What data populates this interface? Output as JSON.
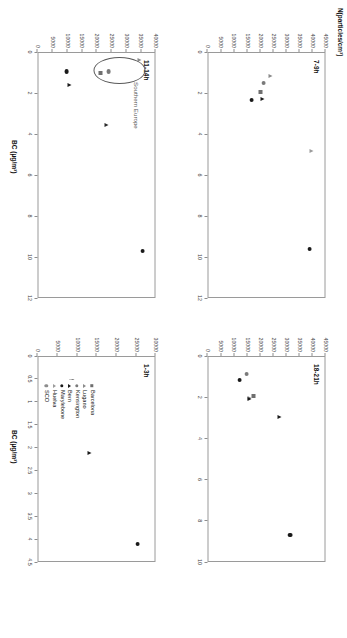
{
  "figure": {
    "y_axis_label": "N(particles/cm³)",
    "x_axis_label": "BC (µg/m³)",
    "annotation_text": "Southern Europe"
  },
  "legend": {
    "items": [
      {
        "label": "Barcelona",
        "marker": "square",
        "color": "#6f6f6f"
      },
      {
        "label": "Lugano",
        "marker": "triangle",
        "color": "#8a8a8a"
      },
      {
        "label": "Kensington",
        "marker": "circle",
        "color": "#7a7a7a"
      },
      {
        "label": "Bern",
        "marker": "triangle",
        "color": "#1a1a1a"
      },
      {
        "label": "Marylebone",
        "marker": "circle",
        "color": "#1a1a1a"
      },
      {
        "label": "Huelva",
        "marker": "triangle",
        "color": "#9b9b9b"
      },
      {
        "label": "SCO",
        "marker": "circle",
        "color": "#8d8d8d"
      }
    ]
  },
  "chart_data": [
    {
      "id": "panel-7-9h",
      "type": "scatter",
      "title": "7-9h",
      "xlabel": "BC (µg/m³)",
      "ylabel": "N(particles/cm³)",
      "xlim": [
        0,
        12
      ],
      "ylim": [
        0,
        45000
      ],
      "xticks": [
        0,
        2,
        4,
        6,
        8,
        10,
        12
      ],
      "yticks": [
        0,
        5000,
        10000,
        15000,
        20000,
        25000,
        30000,
        35000,
        40000,
        45000
      ],
      "grid": false,
      "points": [
        {
          "site": "Barcelona",
          "marker": "square",
          "color": "#6f6f6f",
          "x": 1.95,
          "y": 20200
        },
        {
          "site": "Lugano",
          "marker": "triangle",
          "color": "#8a8a8a",
          "x": 1.15,
          "y": 24200
        },
        {
          "site": "Kensington",
          "marker": "circle",
          "color": "#7a7a7a",
          "x": 1.5,
          "y": 21500
        },
        {
          "site": "Bern",
          "marker": "triangle",
          "color": "#1a1a1a",
          "x": 2.3,
          "y": 21000
        },
        {
          "site": "Marylebone",
          "marker": "circle",
          "color": "#1a1a1a",
          "x": 2.35,
          "y": 16800
        },
        {
          "site": "Huelva",
          "marker": "triangle",
          "color": "#9b9b9b",
          "x": 4.85,
          "y": 39500
        },
        {
          "site": "SCO",
          "marker": "circle",
          "color": "#1a1a1a",
          "x": 9.6,
          "y": 39000
        }
      ]
    },
    {
      "id": "panel-11-14h",
      "type": "scatter",
      "title": "11-14h",
      "xlabel": "BC (µg/m³)",
      "ylabel": "N(particles/cm³)",
      "xlim": [
        0,
        12
      ],
      "ylim": [
        0,
        40000
      ],
      "xticks": [
        0,
        2,
        4,
        6,
        8,
        10,
        12
      ],
      "yticks": [
        0,
        5000,
        10000,
        15000,
        20000,
        25000,
        30000,
        35000,
        40000
      ],
      "grid": false,
      "annotation": "Southern Europe",
      "points": [
        {
          "site": "Barcelona",
          "marker": "square",
          "color": "#6f6f6f",
          "x": 1.0,
          "y": 21500
        },
        {
          "site": "Lugano",
          "marker": "triangle",
          "color": "#8a8a8a",
          "x": 0.4,
          "y": 34500
        },
        {
          "site": "Kensington",
          "marker": "circle",
          "color": "#7a7a7a",
          "x": 0.95,
          "y": 24000
        },
        {
          "site": "Bern",
          "marker": "triangle",
          "color": "#1a1a1a",
          "x": 1.6,
          "y": 11000
        },
        {
          "site": "Marylebone",
          "marker": "circle",
          "color": "#1a1a1a",
          "x": 0.95,
          "y": 9800
        },
        {
          "site": "Huelva",
          "marker": "triangle",
          "color": "#2a2a2a",
          "x": 3.55,
          "y": 23500
        },
        {
          "site": "SCO",
          "marker": "circle",
          "color": "#1a1a1a",
          "x": 9.7,
          "y": 35500
        }
      ]
    },
    {
      "id": "panel-18-21h",
      "type": "scatter",
      "title": "18-21h",
      "xlabel": "BC (µg/m³)",
      "ylabel": "N(particles/cm³)",
      "xlim": [
        0,
        10
      ],
      "ylim": [
        0,
        45000
      ],
      "xticks": [
        0,
        2,
        4,
        6,
        8,
        10
      ],
      "yticks": [
        0,
        5000,
        10000,
        15000,
        20000,
        25000,
        30000,
        35000,
        40000,
        45000
      ],
      "grid": false,
      "points": [
        {
          "site": "Barcelona",
          "marker": "square",
          "color": "#6f6f6f",
          "x": 1.95,
          "y": 17500
        },
        {
          "site": "Lugano",
          "marker": "triangle",
          "color": "#8a8a8a",
          "x": 2.05,
          "y": 16200
        },
        {
          "site": "Kensington",
          "marker": "circle",
          "color": "#7a7a7a",
          "x": 0.85,
          "y": 14800
        },
        {
          "site": "Bern",
          "marker": "triangle",
          "color": "#1a1a1a",
          "x": 2.1,
          "y": 16000
        },
        {
          "site": "Marylebone",
          "marker": "circle",
          "color": "#1a1a1a",
          "x": 1.15,
          "y": 12200
        },
        {
          "site": "Huelva",
          "marker": "triangle",
          "color": "#1a1a1a",
          "x": 2.95,
          "y": 27500
        },
        {
          "site": "SCO",
          "marker": "circle",
          "color": "#1a1a1a",
          "x": 8.7,
          "y": 31500
        }
      ]
    },
    {
      "id": "panel-1-3h",
      "type": "scatter",
      "title": "1-3h",
      "xlabel": "BC (µg/m³)",
      "ylabel": "N(particles/cm³)",
      "xlim": [
        0,
        4.5
      ],
      "ylim": [
        0,
        30000
      ],
      "xticks": [
        0,
        0.5,
        1,
        1.5,
        2,
        2.5,
        3,
        3.5,
        4,
        4.5
      ],
      "yticks": [
        0,
        5000,
        10000,
        15000,
        20000,
        25000,
        30000
      ],
      "grid": false,
      "points": [
        {
          "site": "Barcelona",
          "marker": "square",
          "color": "#6f6f6f",
          "x": 1.2,
          "y": 8200
        },
        {
          "site": "Lugano",
          "marker": "triangle",
          "color": "#8a8a8a",
          "x": 0.55,
          "y": 8600
        },
        {
          "site": "Kensington",
          "marker": "circle",
          "color": "#7a7a7a",
          "x": 0.55,
          "y": 9000
        },
        {
          "site": "Bern",
          "marker": "triangle",
          "color": "#1a1a1a",
          "x": 1.22,
          "y": 8000
        },
        {
          "site": "Marylebone",
          "marker": "circle",
          "color": "#1a1a1a",
          "x": 0.9,
          "y": 8900
        },
        {
          "site": "Huelva",
          "marker": "triangle",
          "color": "#1a1a1a",
          "x": 2.12,
          "y": 13200
        },
        {
          "site": "SCO",
          "marker": "circle",
          "color": "#1a1a1a",
          "x": 4.1,
          "y": 25400
        }
      ]
    }
  ]
}
